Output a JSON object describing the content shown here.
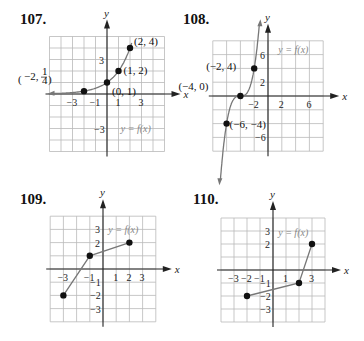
{
  "chart_data": [
    {
      "id": "107",
      "type": "line",
      "title": "107.",
      "xlabel": "x",
      "ylabel": "y",
      "function_label": "y = f(x)",
      "xlim": [
        -5,
        5
      ],
      "ylim": [
        -5,
        5
      ],
      "grid": true,
      "grid_step": 1,
      "x_ticks": [
        -3,
        -1,
        1,
        3
      ],
      "y_ticks": [
        3,
        -3
      ],
      "curve": "exponential 2^x",
      "points": [
        {
          "x": -2,
          "y": 0.25,
          "label": "(−2, 1/4)"
        },
        {
          "x": 0,
          "y": 1,
          "label": "(0, 1)"
        },
        {
          "x": 1,
          "y": 2,
          "label": "(1, 2)"
        },
        {
          "x": 2,
          "y": 4,
          "label": "(2, 4)"
        }
      ]
    },
    {
      "id": "108",
      "type": "line",
      "title": "108.",
      "xlabel": "x",
      "ylabel": "y",
      "function_label": "y = f(x)",
      "xlim": [
        -8,
        8
      ],
      "ylim": [
        -8,
        8
      ],
      "grid": true,
      "grid_step": 2,
      "x_ticks": [
        -2,
        2,
        6
      ],
      "y_ticks": [
        6,
        2,
        -6
      ],
      "curve": "cubic through points",
      "points": [
        {
          "x": -2,
          "y": 4,
          "label": "(−2, 4)"
        },
        {
          "x": -4,
          "y": 0,
          "label": "(−4, 0)"
        },
        {
          "x": -6,
          "y": -4,
          "label": "(−6, −4)"
        }
      ]
    },
    {
      "id": "109",
      "type": "line",
      "title": "109.",
      "xlabel": "x",
      "ylabel": "y",
      "function_label": "y = f(x)",
      "xlim": [
        -4,
        4
      ],
      "ylim": [
        -4,
        4
      ],
      "grid": true,
      "grid_step": 1,
      "x_ticks": [
        -3,
        -1,
        1,
        2,
        3
      ],
      "y_ticks": [
        3,
        2,
        -1,
        -2,
        -3
      ],
      "curve": "piecewise linear",
      "points": [
        {
          "x": -3,
          "y": -2
        },
        {
          "x": -1,
          "y": 1
        },
        {
          "x": 2,
          "y": 2
        }
      ]
    },
    {
      "id": "110",
      "type": "line",
      "title": "110.",
      "xlabel": "x",
      "ylabel": "y",
      "function_label": "y = f(x)",
      "xlim": [
        -4,
        4
      ],
      "ylim": [
        -4,
        4
      ],
      "grid": true,
      "grid_step": 1,
      "x_ticks": [
        -3,
        -2,
        -1,
        1,
        3
      ],
      "y_ticks": [
        3,
        2,
        -1,
        -2,
        -3
      ],
      "curve": "piecewise linear",
      "points": [
        {
          "x": -2,
          "y": -2
        },
        {
          "x": 2,
          "y": -1
        },
        {
          "x": 3,
          "y": 2
        }
      ]
    }
  ]
}
